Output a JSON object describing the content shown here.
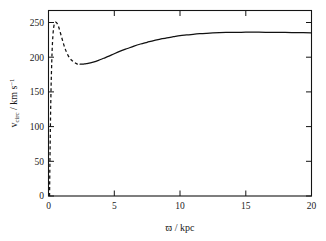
{
  "chart_data": {
    "type": "line",
    "title": "",
    "xlabel": "ϖ / kpc",
    "ylabel": "v_circ / km s⁻¹",
    "ylabel_parts": {
      "symbol": "v",
      "subscript": "circ",
      "separator": " / km s",
      "superscript": "−1"
    },
    "xlabel_parts": {
      "symbol": "ϖ",
      "separator": " / kpc"
    },
    "xlim": [
      0,
      20
    ],
    "ylim": [
      0,
      270
    ],
    "xticks": [
      0,
      5,
      10,
      15,
      20
    ],
    "xtick_labels": [
      "0",
      "5",
      "10",
      "15",
      "20"
    ],
    "yticks": [
      0,
      50,
      100,
      150,
      200,
      250
    ],
    "ytick_labels": [
      "0",
      "50",
      "100",
      "150",
      "200",
      "250"
    ],
    "grid": false,
    "legend": null,
    "series": [
      {
        "name": "inner-rotation-curve",
        "style": "dashed",
        "color": "#111111",
        "x": [
          0.08,
          0.1,
          0.13,
          0.16,
          0.2,
          0.25,
          0.3,
          0.36,
          0.42,
          0.5,
          0.6,
          0.7,
          0.8,
          0.95,
          1.1,
          1.25,
          1.4,
          1.6,
          1.8,
          2.0,
          2.2,
          2.4
        ],
        "y": [
          0,
          35,
          80,
          120,
          160,
          195,
          220,
          237,
          246,
          250,
          250,
          247,
          242,
          232,
          222,
          213,
          206,
          199,
          195,
          192,
          190,
          190
        ]
      },
      {
        "name": "outer-rotation-curve",
        "style": "solid",
        "color": "#111111",
        "x": [
          2.4,
          2.6,
          2.8,
          3.0,
          3.4,
          3.8,
          4.2,
          4.6,
          5.0,
          5.5,
          6.0,
          6.5,
          7.0,
          7.5,
          8.0,
          8.5,
          9.0,
          9.5,
          10.0,
          10.5,
          11.0,
          11.5,
          12.0,
          12.5,
          13.0,
          13.5,
          14.0,
          15.0,
          16.0,
          17.0,
          18.0,
          19.0,
          20.0
        ],
        "y": [
          190,
          190,
          190.5,
          191,
          193,
          195.5,
          198.5,
          201.5,
          205,
          209,
          212.5,
          216,
          219,
          221.5,
          224,
          226,
          228,
          229.5,
          231,
          232,
          233,
          233.8,
          234.4,
          234.9,
          235.3,
          235.6,
          235.8,
          236,
          236,
          235.8,
          235.6,
          235.4,
          235.2
        ]
      }
    ],
    "annotations": {
      "peak_value": 250,
      "peak_x": 0.5,
      "dip_value": 190,
      "dip_x": 2.5,
      "plateau_value": 236
    }
  },
  "axes": {
    "frame_color": "#141414",
    "background": "#ffffff"
  }
}
